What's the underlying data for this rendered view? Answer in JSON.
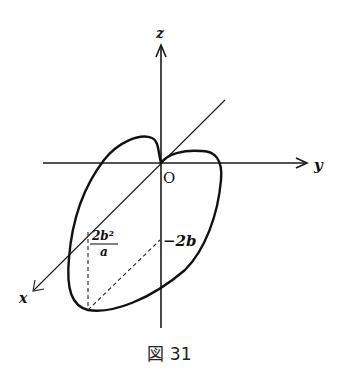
{
  "figure": {
    "axes": {
      "x_label": "x",
      "y_label": "y",
      "z_label": "z",
      "origin_label": "O"
    },
    "annotations": {
      "fraction_numerator": "2b²",
      "fraction_denominator": "a",
      "z_marker": "−2b"
    },
    "caption": "図 31"
  },
  "colors": {
    "ink": "#111111",
    "background": "#ffffff"
  }
}
